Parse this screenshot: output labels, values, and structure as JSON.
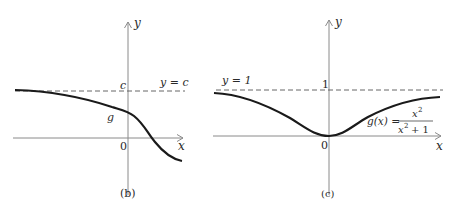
{
  "panel_b": {
    "caption": "(b)",
    "x_axis_label": "x",
    "y_axis_label": "y",
    "origin_label": "0",
    "asymptote_label": "y = c",
    "asymptote_tick_label": "c",
    "curve_label": "g"
  },
  "panel_c": {
    "caption": "(c)",
    "x_axis_label": "x",
    "y_axis_label": "y",
    "origin_label": "0",
    "asymptote_label": "y = 1",
    "asymptote_tick_label": "1",
    "curve_label_lhs": "g(x) =",
    "curve_label_num": "x",
    "curve_label_num_exp": "2",
    "curve_label_den": "x",
    "curve_label_den_exp": "2",
    "curve_label_den_rest": "+ 1"
  },
  "colors": {
    "curve": "#1a1a1a",
    "axis": "#8a8a8a",
    "dashed": "#555555",
    "text": "#2a2a2a"
  }
}
